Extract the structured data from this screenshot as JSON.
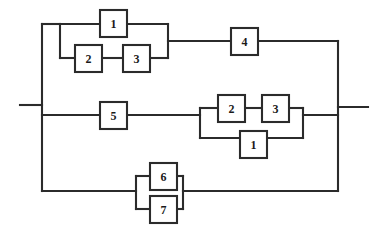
{
  "diagram": {
    "type": "reliability-block-diagram",
    "canvas": {
      "width": 387,
      "height": 237
    },
    "style": {
      "line_color": "#2b2b2b",
      "block_fill": "#ffffff",
      "block_stroke": "#2b2b2b",
      "label_color": "#1a1a1a",
      "background": "#ffffff",
      "line_width": 2.1
    },
    "terminals": {
      "input_label": "",
      "output_label": ""
    },
    "blocks": [
      {
        "id": "b1",
        "label": "1",
        "x": 100,
        "y": 10,
        "w": 27,
        "h": 27,
        "branch": "top",
        "group": "top-parallel-upper"
      },
      {
        "id": "b2",
        "label": "2",
        "x": 75,
        "y": 45,
        "w": 27,
        "h": 27,
        "branch": "top",
        "group": "top-parallel-lower"
      },
      {
        "id": "b3",
        "label": "3",
        "x": 123,
        "y": 45,
        "w": 27,
        "h": 27,
        "branch": "top",
        "group": "top-parallel-lower"
      },
      {
        "id": "b4",
        "label": "4",
        "x": 231,
        "y": 28,
        "w": 27,
        "h": 27,
        "branch": "top",
        "group": "top-series"
      },
      {
        "id": "b5",
        "label": "5",
        "x": 100,
        "y": 102,
        "w": 27,
        "h": 27,
        "branch": "middle",
        "group": "middle-series"
      },
      {
        "id": "b6",
        "label": "2",
        "x": 218,
        "y": 95,
        "w": 27,
        "h": 27,
        "branch": "middle",
        "group": "middle-parallel-upper"
      },
      {
        "id": "b7",
        "label": "3",
        "x": 262,
        "y": 95,
        "w": 27,
        "h": 27,
        "branch": "middle",
        "group": "middle-parallel-upper"
      },
      {
        "id": "b8",
        "label": "1",
        "x": 240,
        "y": 131,
        "w": 27,
        "h": 27,
        "branch": "middle",
        "group": "middle-parallel-lower"
      },
      {
        "id": "b9",
        "label": "6",
        "x": 150,
        "y": 163,
        "w": 27,
        "h": 27,
        "branch": "bottom",
        "group": "bottom-parallel-upper"
      },
      {
        "id": "b10",
        "label": "7",
        "x": 150,
        "y": 196,
        "w": 27,
        "h": 27,
        "branch": "bottom",
        "group": "bottom-parallel-lower"
      }
    ],
    "wires": [
      {
        "name": "input-stub",
        "points": "20,105 42,105"
      },
      {
        "name": "output-stub",
        "points": "338,107 368,107"
      },
      {
        "name": "left-bus",
        "points": "42,24 42,191"
      },
      {
        "name": "right-bus",
        "points": "338,41 338,191"
      },
      {
        "name": "top-branch-left-lead",
        "points": "42,24 60,24"
      },
      {
        "name": "top-group-left-rail",
        "points": "60,24 60,58"
      },
      {
        "name": "top-upper-lead-in",
        "points": "60,24 100,24"
      },
      {
        "name": "top-upper-lead-out",
        "points": "127,24 168,24"
      },
      {
        "name": "top-lower-lead-in",
        "points": "60,58 75,58"
      },
      {
        "name": "top-lower-mid",
        "points": "102,58 123,58"
      },
      {
        "name": "top-lower-lead-out",
        "points": "150,58 168,58"
      },
      {
        "name": "top-group-right-rail",
        "points": "168,24 168,58"
      },
      {
        "name": "top-to-block4",
        "points": "168,41 231,41"
      },
      {
        "name": "block4-to-right-bus",
        "points": "258,41 338,41"
      },
      {
        "name": "middle-branch-lead",
        "points": "42,115 100,115"
      },
      {
        "name": "block5-to-group",
        "points": "127,115 200,115"
      },
      {
        "name": "mid-group-left-rail",
        "points": "200,108 200,138"
      },
      {
        "name": "mid-upper-lead-in",
        "points": "200,108 218,108"
      },
      {
        "name": "mid-upper-mid",
        "points": "245,108 262,108"
      },
      {
        "name": "mid-upper-lead-out",
        "points": "289,108 303,108"
      },
      {
        "name": "mid-lower-lead-in",
        "points": "200,138 240,138"
      },
      {
        "name": "mid-lower-lead-out",
        "points": "267,138 303,138"
      },
      {
        "name": "mid-group-right-rail",
        "points": "303,108 303,138"
      },
      {
        "name": "mid-group-to-right-bus",
        "points": "303,115 338,115"
      },
      {
        "name": "bottom-branch-lead",
        "points": "42,191 136,191"
      },
      {
        "name": "bot-group-left-rail",
        "points": "136,176 136,209"
      },
      {
        "name": "bot-upper-lead-in",
        "points": "136,176 150,176"
      },
      {
        "name": "bot-upper-lead-out",
        "points": "177,176 183,176"
      },
      {
        "name": "bot-lower-lead-in",
        "points": "136,209 150,209"
      },
      {
        "name": "bot-lower-lead-out",
        "points": "177,209 183,209"
      },
      {
        "name": "bot-group-right-rail",
        "points": "183,176 183,209"
      },
      {
        "name": "bot-group-to-right-bus",
        "points": "183,191 338,191"
      }
    ]
  }
}
